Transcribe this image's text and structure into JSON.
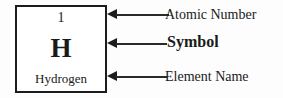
{
  "element_cell": {
    "atomic_number": "1",
    "symbol": "H",
    "element_name": "Hydrogen"
  },
  "callouts": [
    {
      "label": "Atomic Number",
      "points_to": "atomic-number"
    },
    {
      "label": "Symbol",
      "points_to": "symbol"
    },
    {
      "label": "Element Name",
      "points_to": "element-name"
    }
  ],
  "colors": {
    "box_border": "#1c1c1c",
    "text": "#1a1a1a",
    "leader_line": "#2a2a2a",
    "background": "#fdfdfd"
  }
}
